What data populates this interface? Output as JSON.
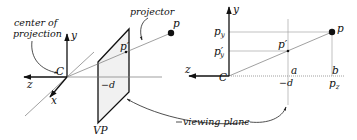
{
  "figure": {
    "left_panel": {
      "title": "3D perspective view",
      "labels": {
        "center_of_projection_line1": "center of",
        "center_of_projection_line2": "projection",
        "projector": "projector",
        "origin": "C",
        "y_axis": "y",
        "z_axis": "z",
        "x_axis": "x",
        "point": "p",
        "projected_point": "p′",
        "distance": "−d",
        "plane": "VP"
      }
    },
    "right_panel": {
      "title": "side view (y–z plane)",
      "labels": {
        "origin": "C",
        "y_axis": "y",
        "z_axis": "z",
        "point": "p",
        "projected_point": "p′",
        "p_y": "p",
        "p_y_sub": "y",
        "p_prime_y": "p′",
        "p_prime_y_sub": "y",
        "a": "a",
        "b": "b",
        "distance": "−d",
        "p_z": "p",
        "p_z_sub": "z",
        "viewing_plane": "viewing plane"
      }
    },
    "colors": {
      "ink": "#111111",
      "plane_fill": "#f1f1f1",
      "guide": "#999999"
    }
  }
}
